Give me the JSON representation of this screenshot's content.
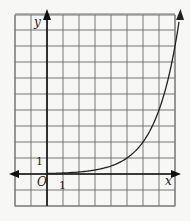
{
  "chart_data": {
    "type": "line",
    "title": "",
    "xlabel": "x",
    "ylabel": "y",
    "origin_label": "O",
    "tick_labels": {
      "x": "1",
      "y": "1"
    },
    "xlim": [
      -2,
      8
    ],
    "ylim": [
      -2,
      10
    ],
    "grid": true,
    "series": [
      {
        "name": "exponential curve",
        "function": "y = 2^(x-5)",
        "x": [
          0,
          1,
          2,
          3,
          4,
          5,
          6,
          7,
          8,
          8.5
        ],
        "values": [
          0.03,
          0.06,
          0.13,
          0.25,
          0.5,
          1,
          2,
          4,
          8,
          11.3
        ]
      }
    ],
    "arrows": {
      "x_axis": "both",
      "y_axis": "up",
      "curve": "up"
    }
  },
  "labels": {
    "y_axis": "y",
    "x_axis": "x",
    "origin": "O",
    "x_tick": "1",
    "y_tick": "1"
  }
}
